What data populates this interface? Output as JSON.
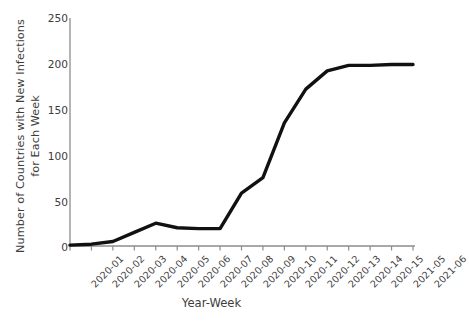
{
  "chart_data": {
    "type": "line",
    "title": "",
    "xlabel": "Year-Week",
    "ylabel": "Number of Countries with New Infections for Each Week",
    "ylabel_line1": "Number of Countries with New Infections",
    "ylabel_line2": "for Each Week",
    "categories": [
      "2020-01",
      "2020-02",
      "2020-03",
      "2020-04",
      "2020-05",
      "2020-06",
      "2020-07",
      "2020-08",
      "2020-09",
      "2020-10",
      "2020-11",
      "2020-12",
      "2020-13",
      "2020-14",
      "2020-15",
      "2021-05",
      "2021-06"
    ],
    "values": [
      1,
      2,
      5,
      15,
      25,
      20,
      19,
      19,
      58,
      75,
      135,
      172,
      192,
      198,
      198,
      199,
      199
    ],
    "series": [
      {
        "name": "Countries with new infections",
        "values": [
          1,
          2,
          5,
          15,
          25,
          20,
          19,
          19,
          58,
          75,
          135,
          172,
          192,
          198,
          198,
          199,
          199
        ],
        "color": "#000000"
      }
    ],
    "ylim": [
      0,
      250
    ],
    "yticks": [
      0,
      50,
      100,
      150,
      200,
      250
    ],
    "ytick_labels": [
      "0",
      "50",
      "100",
      "150",
      "200",
      "250"
    ],
    "grid": false,
    "legend": "none",
    "line_color": "#111111",
    "axis_color": "#8d8d8d"
  }
}
